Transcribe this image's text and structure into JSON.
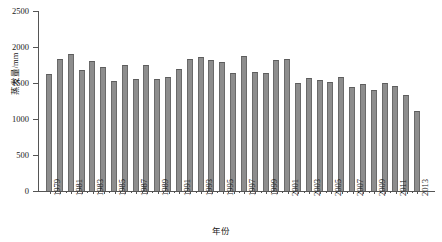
{
  "chart_data": {
    "type": "bar",
    "title": "",
    "xlabel": "年份",
    "ylabel": "蒸发量/mm",
    "ylim": [
      0,
      2500
    ],
    "yticks": [
      0,
      500,
      1000,
      1500,
      2000,
      2500
    ],
    "grid": false,
    "legend": "none",
    "xtick_step": 2,
    "categories": [
      "1979",
      "1980",
      "1981",
      "1982",
      "1983",
      "1984",
      "1985",
      "1986",
      "1987",
      "1988",
      "1989",
      "1990",
      "1991",
      "1992",
      "1993",
      "1994",
      "1995",
      "1996",
      "1997",
      "1998",
      "1999",
      "2000",
      "2001",
      "2002",
      "2003",
      "2004",
      "2005",
      "2006",
      "2007",
      "2008",
      "2009",
      "2010",
      "2011",
      "2012",
      "2013"
    ],
    "xtick_labels": [
      "1979",
      "1981",
      "1983",
      "1985",
      "1987",
      "1989",
      "1991",
      "1993",
      "1995",
      "1997",
      "1999",
      "2001",
      "2003",
      "2005",
      "2007",
      "2009",
      "2011",
      "2013"
    ],
    "values": [
      1620,
      1830,
      1900,
      1680,
      1805,
      1725,
      1525,
      1755,
      1550,
      1750,
      1560,
      1580,
      1700,
      1830,
      1855,
      1820,
      1785,
      1640,
      1870,
      1655,
      1645,
      1815,
      1830,
      1495,
      1570,
      1545,
      1510,
      1590,
      1450,
      1490,
      1400,
      1500,
      1465,
      1340,
      1115
    ],
    "bar_color": "#8d8d8d",
    "bar_edge_color": "#5d5d5d",
    "axis_color": "#555555"
  }
}
